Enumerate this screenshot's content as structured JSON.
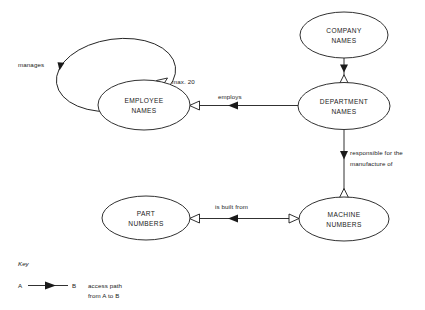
{
  "diagram": {
    "type": "entity-access-path-diagram",
    "entities": [
      {
        "id": "employee",
        "line1": "EMPLOYEE",
        "line2": "NAMES"
      },
      {
        "id": "company",
        "line1": "COMPANY",
        "line2": "NAMES"
      },
      {
        "id": "department",
        "line1": "DEPARTMENT",
        "line2": "NAMES"
      },
      {
        "id": "part",
        "line1": "PART",
        "line2": "NUMBERS"
      },
      {
        "id": "machine",
        "line1": "MACHINE",
        "line2": "NUMBERS"
      }
    ],
    "links": [
      {
        "id": "manages",
        "label": "manages",
        "from": "employee",
        "to": "employee"
      },
      {
        "id": "max20",
        "label": "max. 20",
        "from": "employee",
        "to": "employee"
      },
      {
        "id": "employs",
        "label": "employs",
        "from": "department",
        "to": "employee"
      },
      {
        "id": "responsible",
        "label_line1": "responsible for the",
        "label_line2": "manufacture of",
        "from": "company",
        "to": "department"
      },
      {
        "id": "built",
        "label": "is built from",
        "from": "machine",
        "to": "part"
      }
    ]
  },
  "key": {
    "title": "Key",
    "a": "A",
    "b": "B",
    "desc_line1": "access path",
    "desc_line2": "from A to B"
  },
  "colors": {
    "stroke": "#1a1a1a",
    "fill": "#ffffff"
  }
}
